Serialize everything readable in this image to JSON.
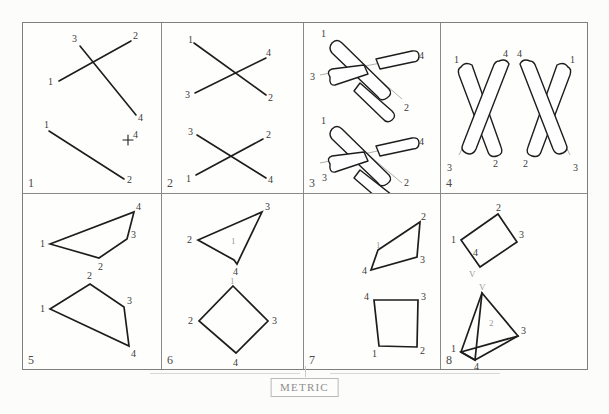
{
  "sheet": {
    "title": "Metric mental-rotation figure sheet",
    "footer_label": "METRIC",
    "background_color": "#fcfcfa",
    "ink_color": "#1d1d1d",
    "border_color": "#7e7e7e"
  },
  "grid": {
    "columns": 4,
    "rows": 2,
    "panel_numbers": [
      "1",
      "2",
      "3",
      "4",
      "5",
      "6",
      "7",
      "8"
    ]
  },
  "panels": [
    {
      "number": "1",
      "kind": "line-segments",
      "description": "Two crossing straight segments above, one lone segment below with a plus-four tick",
      "vertex_labels": [
        "3",
        "2",
        "1",
        "4",
        "1",
        "4",
        "2"
      ]
    },
    {
      "number": "2",
      "kind": "line-segments",
      "description": "Two X-crossings of plain line segments",
      "vertex_labels": [
        "1",
        "4",
        "3",
        "2",
        "3",
        "2",
        "1",
        "4"
      ]
    },
    {
      "number": "3",
      "kind": "rods-3d",
      "description": "Two crossed three-dimensional rod pairs, upper and lower",
      "vertex_labels": [
        "1",
        "4",
        "3",
        "2",
        "1",
        "4",
        "3",
        "2"
      ]
    },
    {
      "number": "4",
      "kind": "rods-3d",
      "description": "Two mirrored X rod pairs side by side",
      "vertex_labels": [
        "1",
        "4",
        "3",
        "2",
        "4",
        "1",
        "2",
        "3"
      ]
    },
    {
      "number": "5",
      "kind": "polygon",
      "description": "Two quadrilaterals, upper arrow-like and lower kite-like",
      "vertex_labels": [
        "4",
        "3",
        "1",
        "2",
        "2",
        "3",
        "1",
        "4"
      ]
    },
    {
      "number": "6",
      "kind": "polygon",
      "description": "Upper narrow quadrilateral with interior label, lower diamond",
      "vertex_labels": [
        "3",
        "2",
        "4",
        "1",
        "1",
        "2",
        "3",
        "4"
      ]
    },
    {
      "number": "7",
      "kind": "polygon",
      "description": "Two small quadrilaterals set to the right of the cell",
      "vertex_labels": [
        "2",
        "1",
        "3",
        "4",
        "4",
        "3",
        "1",
        "2"
      ]
    },
    {
      "number": "8",
      "kind": "polygon",
      "description": "Two tilted quadrilaterals with V annotations",
      "vertex_labels": [
        "2",
        "3",
        "1",
        "4",
        "V",
        "V",
        "3",
        "1",
        "4",
        "2"
      ]
    }
  ],
  "annotations": {
    "plus_four": "+4",
    "v_mark_upper": "V",
    "v_mark_lower": "V",
    "interior_one_p6": "1",
    "interior_one_p5": "3",
    "interior_two_p8": "2"
  }
}
